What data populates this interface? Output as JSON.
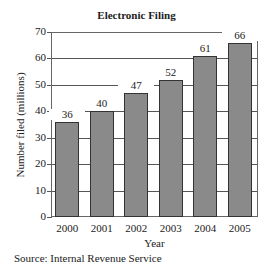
{
  "chart_data": {
    "type": "bar",
    "title": "Electronic Filing",
    "xlabel": "Year",
    "ylabel": "Number filed (millions)",
    "categories": [
      "2000",
      "2001",
      "2002",
      "2003",
      "2004",
      "2005"
    ],
    "values": [
      36,
      40,
      47,
      52,
      61,
      66
    ],
    "ylim": [
      0,
      70
    ],
    "yticks": [
      0,
      10,
      20,
      30,
      40,
      50,
      60,
      70
    ],
    "grid": true,
    "bar_color": "#8a8a8a",
    "data_labels": true,
    "source": "Source: Internal Revenue Service"
  }
}
